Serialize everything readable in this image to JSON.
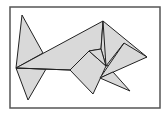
{
  "diagram": {
    "type": "tangram-fish",
    "colors": {
      "fill": "#d9d9d9",
      "stroke": "#222222",
      "frame": "#555555",
      "background": "#ffffff"
    },
    "frame": {
      "x": 10,
      "y": 7,
      "width": 150,
      "height": 101
    },
    "pieces": [
      {
        "name": "tail-top-triangle",
        "points": "22,15 43,53 16,68"
      },
      {
        "name": "tail-bottom-triangle",
        "points": "16,68 46,69 28,100"
      },
      {
        "name": "body-large-triangle",
        "points": "16,68 103,21 101,49 89,51 70,70"
      },
      {
        "name": "head-triangle",
        "points": "103,21 147,57 106,66 101,49"
      },
      {
        "name": "fin-square",
        "points": "89,51 106,66 93,94 70,70"
      },
      {
        "name": "mid-triangle",
        "points": "124,43 147,57 100,78"
      },
      {
        "name": "lower-fin-triangle",
        "points": "100,78 113,72 130,91"
      },
      {
        "name": "notch-triangle",
        "points": "89,51 101,49 106,66"
      }
    ],
    "lines": [
      {
        "name": "body-base-line",
        "points": "16,68 70,70"
      },
      {
        "name": "head-divider-line",
        "points": "103,21 106,66"
      },
      {
        "name": "mid-divider-line",
        "points": "124,43 106,66"
      }
    ]
  }
}
